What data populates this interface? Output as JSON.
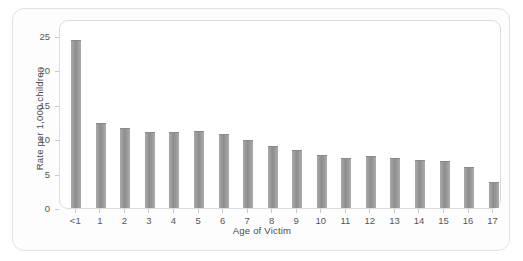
{
  "chart_data": {
    "type": "bar",
    "title": "",
    "subtitle": "",
    "xlabel": "Age of Victim",
    "ylabel": "Rate per 1,000 children",
    "categories": [
      "<1",
      "1",
      "2",
      "3",
      "4",
      "5",
      "6",
      "7",
      "8",
      "9",
      "10",
      "11",
      "12",
      "13",
      "14",
      "15",
      "16",
      "17"
    ],
    "values": [
      24.4,
      12.3,
      11.6,
      11.0,
      11.0,
      11.2,
      10.7,
      9.9,
      9.0,
      8.4,
      7.7,
      7.3,
      7.5,
      7.2,
      7.0,
      6.9,
      6.0,
      3.8
    ],
    "ylim": [
      0,
      25
    ],
    "yticks": [
      0,
      5,
      10,
      15,
      20,
      25
    ],
    "ytick_labels": [
      "0",
      "5",
      "10",
      "15",
      "20",
      "25"
    ],
    "grid": false,
    "legend": null,
    "legend_position": "none",
    "annotations": [],
    "bar_color": "#9a9a9a",
    "frame_color": "#dcdcdc",
    "text_color": "#4a4a4a",
    "background_color": "#ffffff"
  }
}
